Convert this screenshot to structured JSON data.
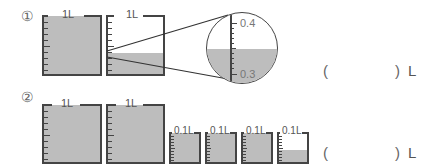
{
  "problems": [
    {
      "number": "①",
      "beakers": [
        {
          "label": "1L",
          "capacity": "1L",
          "fill_fraction": 1.0
        },
        {
          "label": "1L",
          "capacity": "1L",
          "fill_fraction": 0.36
        }
      ],
      "magnifier": {
        "upper_label": "0.4",
        "lower_label": "0.3",
        "fill_level": 0.36
      },
      "answer": {
        "open_paren": "(",
        "close_paren": ")",
        "unit": "L"
      }
    },
    {
      "number": "②",
      "beakers": [
        {
          "label": "1L",
          "capacity": "1L",
          "fill_fraction": 1.0
        },
        {
          "label": "1L",
          "capacity": "1L",
          "fill_fraction": 1.0
        },
        {
          "label": "0.1L",
          "capacity": "0.1L",
          "fill_fraction": 1.0
        },
        {
          "label": "0.1L",
          "capacity": "0.1L",
          "fill_fraction": 1.0
        },
        {
          "label": "0.1L",
          "capacity": "0.1L",
          "fill_fraction": 1.0
        },
        {
          "label": "0.1L",
          "capacity": "0.1L",
          "fill_fraction": 0.4
        }
      ],
      "answer": {
        "open_paren": "(",
        "close_paren": ")",
        "unit": "L"
      }
    }
  ],
  "colors": {
    "fill": "#bdbdbd",
    "outline": "#444444"
  }
}
